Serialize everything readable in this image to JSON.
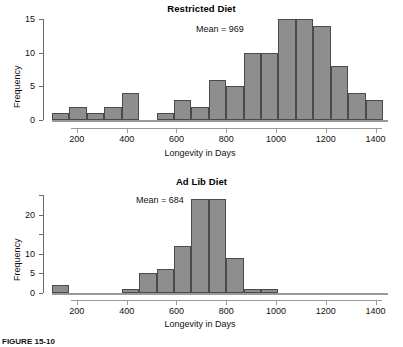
{
  "figure": {
    "caption": "FIGURE 15-10"
  },
  "chart_data": [
    {
      "type": "bar",
      "id": "restricted-diet",
      "title": "Restricted Diet",
      "subtype": "histogram",
      "xlabel": "Longevity in Days",
      "ylabel": "Frequency",
      "annotation": "Mean = 969",
      "mean": 969,
      "grid": false,
      "legend": "none",
      "xlim": [
        100,
        1450
      ],
      "ylim": [
        0,
        15.5
      ],
      "xticks": [
        200,
        400,
        600,
        800,
        1000,
        1200,
        1400
      ],
      "xtick_labels": [
        "200",
        "400",
        "600",
        "800",
        "1000",
        "1200",
        "1400"
      ],
      "yticks": [
        0,
        5,
        10,
        15
      ],
      "ytick_labels": [
        "0",
        "5",
        "10",
        "15"
      ],
      "bin_width": 70,
      "bins": [
        {
          "x0": 100,
          "x1": 170,
          "value": 1
        },
        {
          "x0": 170,
          "x1": 240,
          "value": 2
        },
        {
          "x0": 240,
          "x1": 310,
          "value": 1
        },
        {
          "x0": 310,
          "x1": 380,
          "value": 2
        },
        {
          "x0": 380,
          "x1": 450,
          "value": 4
        },
        {
          "x0": 450,
          "x1": 520,
          "value": 0
        },
        {
          "x0": 520,
          "x1": 590,
          "value": 1
        },
        {
          "x0": 590,
          "x1": 660,
          "value": 3
        },
        {
          "x0": 660,
          "x1": 730,
          "value": 2
        },
        {
          "x0": 730,
          "x1": 800,
          "value": 6
        },
        {
          "x0": 800,
          "x1": 870,
          "value": 5
        },
        {
          "x0": 870,
          "x1": 940,
          "value": 10
        },
        {
          "x0": 940,
          "x1": 1010,
          "value": 10
        },
        {
          "x0": 1010,
          "x1": 1080,
          "value": 15
        },
        {
          "x0": 1080,
          "x1": 1150,
          "value": 15
        },
        {
          "x0": 1150,
          "x1": 1220,
          "value": 14
        },
        {
          "x0": 1220,
          "x1": 1290,
          "value": 8
        },
        {
          "x0": 1290,
          "x1": 1360,
          "value": 4
        },
        {
          "x0": 1360,
          "x1": 1430,
          "value": 3
        }
      ]
    },
    {
      "type": "bar",
      "id": "ad-lib-diet",
      "title": "Ad Lib Diet",
      "subtype": "histogram",
      "xlabel": "Longevity in Days",
      "ylabel": "Frequency",
      "annotation": "Mean = 684",
      "mean": 684,
      "grid": false,
      "legend": "none",
      "xlim": [
        100,
        1450
      ],
      "ylim": [
        0,
        26
      ],
      "xticks": [
        200,
        400,
        600,
        800,
        1000,
        1200,
        1400
      ],
      "xtick_labels": [
        "200",
        "400",
        "600",
        "800",
        "1000",
        "1200",
        "1400"
      ],
      "yticks": [
        0,
        5,
        10,
        15,
        20,
        25
      ],
      "ytick_labels": [
        "0",
        "5",
        "10",
        "",
        "20",
        ""
      ],
      "bin_width": 70,
      "bins": [
        {
          "x0": 100,
          "x1": 170,
          "value": 2
        },
        {
          "x0": 170,
          "x1": 240,
          "value": 0
        },
        {
          "x0": 240,
          "x1": 310,
          "value": 0
        },
        {
          "x0": 310,
          "x1": 380,
          "value": 0
        },
        {
          "x0": 380,
          "x1": 450,
          "value": 1
        },
        {
          "x0": 450,
          "x1": 520,
          "value": 5
        },
        {
          "x0": 520,
          "x1": 590,
          "value": 6
        },
        {
          "x0": 590,
          "x1": 660,
          "value": 12
        },
        {
          "x0": 660,
          "x1": 730,
          "value": 24
        },
        {
          "x0": 730,
          "x1": 800,
          "value": 24
        },
        {
          "x0": 800,
          "x1": 870,
          "value": 9
        },
        {
          "x0": 870,
          "x1": 940,
          "value": 1
        },
        {
          "x0": 940,
          "x1": 1010,
          "value": 1
        }
      ]
    }
  ],
  "style": {
    "bar_fill": "#8e8e8e",
    "bar_border": "#4a4a4a",
    "axis_color": "#9a9a9a",
    "text_color": "#111111"
  }
}
